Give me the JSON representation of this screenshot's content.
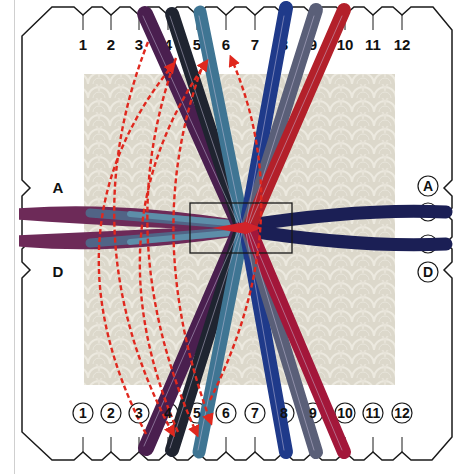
{
  "figure": {
    "type": "braiding-disk-instruction-diagram",
    "background_tile_color": "#dcd8cb",
    "disk_outline_color": "#1a1a1a",
    "move_arrow_color": "#e0281e"
  },
  "top_slots": {
    "labels": [
      "1",
      "2",
      "3",
      "4",
      "5",
      "6",
      "7",
      "8",
      "9",
      "10",
      "11",
      "12"
    ],
    "style": "plain"
  },
  "bottom_slots": {
    "labels": [
      "1",
      "2",
      "3",
      "4",
      "5",
      "6",
      "7",
      "8",
      "9",
      "10",
      "11",
      "12"
    ],
    "style": "circled"
  },
  "left_slots": {
    "labels": [
      "A",
      "D"
    ],
    "style": "plain"
  },
  "right_slots": {
    "labels": [
      "A",
      "D"
    ],
    "style": "circled"
  },
  "strands": [
    {
      "name": "purple-strand",
      "from_top": "3",
      "to_bottom": "4",
      "color": "#4a1f4f"
    },
    {
      "name": "black-strand",
      "from_top": "4",
      "to_bottom": "5",
      "color": "#1f2430"
    },
    {
      "name": "teal-strand",
      "from_top": "5",
      "to_bottom": "6",
      "color": "#3f7593"
    },
    {
      "name": "royal-blue-strand",
      "from_top": "8",
      "to_bottom": "8",
      "color": "#1f3a8a"
    },
    {
      "name": "slate-strand",
      "from_top": "9",
      "to_bottom": "9",
      "color": "#5a5f78"
    },
    {
      "name": "red-strand",
      "from_top": "10",
      "to_bottom": "10",
      "color": "#b3202a"
    },
    {
      "name": "left-strand-A",
      "from_side": "A-left",
      "color": "#6d1f4a"
    },
    {
      "name": "left-strand-D",
      "from_side": "D-left",
      "color": "#6d1f4a"
    },
    {
      "name": "right-strand-A",
      "from_side": "A-right",
      "color": "#1b1f55"
    },
    {
      "name": "right-strand-D",
      "from_side": "D-right",
      "color": "#1b1f55"
    }
  ],
  "moves": [
    {
      "from": "bottom-3",
      "to": "top-4",
      "style": "dashed-arrow"
    },
    {
      "from": "bottom-4",
      "to": "top-5",
      "style": "dashed-arrow"
    },
    {
      "from": "top-3",
      "to": "bottom-4",
      "style": "dashed-arrow"
    },
    {
      "from": "top-4",
      "to": "bottom-5",
      "style": "dashed-arrow"
    },
    {
      "from": "bottom-5",
      "to": "top-6",
      "style": "dashed-arrow"
    },
    {
      "from": "top-5",
      "to": "bottom-6",
      "style": "dashed-arrow"
    }
  ]
}
